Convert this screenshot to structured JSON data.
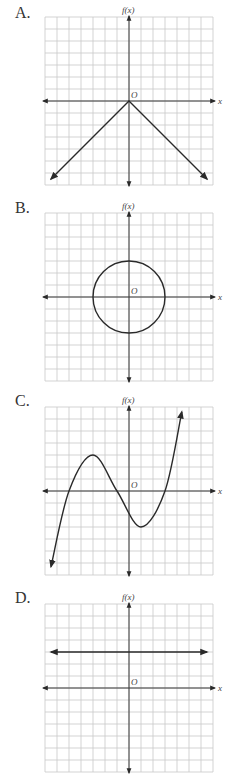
{
  "options": [
    {
      "letter": "A.",
      "ylabel": "f(x)",
      "xlabel": "x",
      "origin_label": "O",
      "description": "Inverted absolute value V, vertex at origin",
      "equation": "f(x) = -|x|"
    },
    {
      "letter": "B.",
      "ylabel": "f(x)",
      "xlabel": "x",
      "origin_label": "O",
      "description": "Circle centered at origin, radius 3",
      "equation": "x^2 + y^2 = 9"
    },
    {
      "letter": "C.",
      "ylabel": "f(x)",
      "xlabel": "x",
      "origin_label": "O",
      "description": "Cubic curve with roots near -5, -1, 3; local max near (-3, 3), local min near (1, -3)"
    },
    {
      "letter": "D.",
      "ylabel": "f(x)",
      "xlabel": "x",
      "origin_label": "O",
      "description": "Horizontal line at y = 3",
      "equation": "f(x) = 3"
    }
  ],
  "colors": {
    "grid": "#c8c8c8",
    "axis": "#3a3a3a",
    "curve": "#2a2a2a"
  },
  "chart_data": [
    {
      "type": "line",
      "title": "A.",
      "xlabel": "x",
      "ylabel": "f(x)",
      "xlim": [
        -7,
        7
      ],
      "ylim": [
        -7,
        7
      ],
      "grid": true,
      "series": [
        {
          "name": "f(x)",
          "x": [
            -6.5,
            0,
            6.5
          ],
          "y": [
            -6.5,
            0,
            -6.5
          ]
        }
      ]
    },
    {
      "type": "line",
      "title": "B.",
      "xlabel": "x",
      "ylabel": "f(x)",
      "xlim": [
        -7,
        7
      ],
      "ylim": [
        -7,
        7
      ],
      "grid": true,
      "series": [
        {
          "name": "circle",
          "center": [
            0,
            0
          ],
          "radius": 3
        }
      ]
    },
    {
      "type": "line",
      "title": "C.",
      "xlabel": "x",
      "ylabel": "f(x)",
      "xlim": [
        -7,
        7
      ],
      "ylim": [
        -7,
        7
      ],
      "grid": true,
      "series": [
        {
          "name": "f(x)",
          "x": [
            -6.5,
            -5,
            -3,
            -1,
            1,
            3,
            4.4
          ],
          "y": [
            -6.3,
            0,
            3,
            0,
            -3,
            0,
            6.6
          ]
        }
      ]
    },
    {
      "type": "line",
      "title": "D.",
      "xlabel": "x",
      "ylabel": "f(x)",
      "xlim": [
        -7,
        7
      ],
      "ylim": [
        -7,
        7
      ],
      "grid": true,
      "series": [
        {
          "name": "f(x)",
          "x": [
            -6.5,
            6.5
          ],
          "y": [
            3,
            3
          ]
        }
      ]
    }
  ]
}
